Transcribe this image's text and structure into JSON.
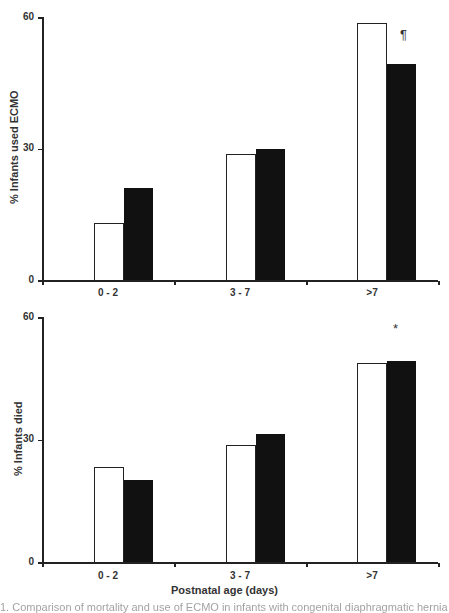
{
  "chart_data": [
    {
      "type": "bar",
      "title": "",
      "xlabel": "",
      "ylabel": "% Infants used ECMO",
      "ylim": [
        0,
        60
      ],
      "yticks": [
        "0",
        "30",
        "60"
      ],
      "categories": [
        "0 - 2",
        "3 - 7",
        ">7"
      ],
      "series": [
        {
          "name": "white",
          "color": "#ffffff",
          "values": [
            13,
            28.8,
            58.7
          ]
        },
        {
          "name": "black",
          "color": "#111111",
          "values": [
            21,
            30,
            49.3
          ]
        }
      ],
      "annotations": [
        {
          "category": ">7",
          "text": "¶"
        }
      ],
      "grid": false,
      "legend": "none"
    },
    {
      "type": "bar",
      "title": "",
      "xlabel": "Postnatal age (days)",
      "ylabel": "% Infants died",
      "ylim": [
        0,
        60
      ],
      "yticks": [
        "0",
        "30",
        "60"
      ],
      "categories": [
        "0 - 2",
        "3 - 7",
        ">7"
      ],
      "series": [
        {
          "name": "white",
          "color": "#ffffff",
          "values": [
            23.3,
            28.7,
            48.8
          ]
        },
        {
          "name": "black",
          "color": "#111111",
          "values": [
            20,
            31.4,
            49.3
          ]
        }
      ],
      "annotations": [
        {
          "category": ">7",
          "text": "*"
        }
      ],
      "grid": false,
      "legend": "none"
    }
  ],
  "caption_fragment": "1. Comparison of mortality and use of ECMO in infants with congenital diaphragmatic hernia by age..."
}
